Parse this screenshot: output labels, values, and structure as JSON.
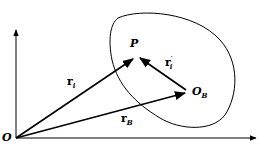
{
  "diagram": {
    "type": "vector-diagram",
    "labels": {
      "origin": "O",
      "point": "P",
      "body_origin": "O",
      "body_origin_sub": "B",
      "r_i": "r",
      "r_i_sub": "i",
      "r_i_prime": "r",
      "r_i_prime_sub": "i",
      "r_i_prime_sup": "′",
      "r_B": "r",
      "r_B_sub": "B"
    },
    "colors": {
      "stroke": "#000000",
      "background": "#ffffff"
    }
  }
}
